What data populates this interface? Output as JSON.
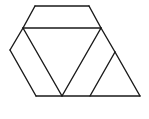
{
  "diagram": {
    "type": "geometric-tiling",
    "stroke_color": "#1a1a1a",
    "background": "#ffffff",
    "vertices": {
      "A": [
        35,
        6
      ],
      "B": [
        89,
        6
      ],
      "C": [
        23,
        28
      ],
      "D": [
        101,
        28
      ],
      "E": [
        10,
        50
      ],
      "F": [
        115,
        52
      ],
      "G": [
        36,
        96
      ],
      "H": [
        62,
        96
      ],
      "I": [
        90,
        96
      ],
      "J": [
        140,
        96
      ]
    },
    "segments": [
      [
        "A",
        "B"
      ],
      [
        "A",
        "C"
      ],
      [
        "B",
        "D"
      ],
      [
        "C",
        "D"
      ],
      [
        "C",
        "E"
      ],
      [
        "E",
        "G"
      ],
      [
        "C",
        "H"
      ],
      [
        "D",
        "H"
      ],
      [
        "D",
        "F"
      ],
      [
        "F",
        "J"
      ],
      [
        "F",
        "I"
      ],
      [
        "G",
        "J"
      ]
    ]
  }
}
